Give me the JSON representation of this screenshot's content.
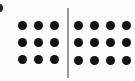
{
  "diagram": {
    "colors": {
      "dot": "#111111",
      "divider": "#9a9a9a",
      "background": "#fdfdfd"
    },
    "left_group": {
      "rows": 3,
      "cols": 3,
      "count": 9,
      "x_centers": [
        22,
        38,
        54
      ],
      "y_centers": [
        25,
        42,
        59
      ]
    },
    "right_group": {
      "rows": 3,
      "cols": 4,
      "count": 12,
      "x_centers": [
        78,
        94,
        110,
        126
      ],
      "y_centers": [
        25,
        42,
        60
      ]
    },
    "divider": {
      "x": 67,
      "y_start": 8,
      "y_end": 78
    }
  }
}
